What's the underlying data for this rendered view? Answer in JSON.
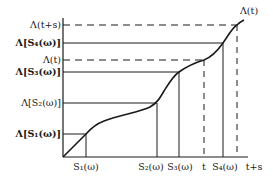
{
  "diagram": {
    "type": "monotone-curve-with-projections",
    "curve_label": "Λ(t)",
    "colors": {
      "ink": "#1a1a1a",
      "background": "#ffffff"
    },
    "y_axis_labels": [
      {
        "id": "lambda_t_plus_s",
        "text": "Λ(t+s)",
        "style": "dashed"
      },
      {
        "id": "lambda_s4",
        "text": "Λ[S₄(ω)]",
        "style": "solid"
      },
      {
        "id": "lambda_t",
        "text": "Λ(t)",
        "style": "dashed"
      },
      {
        "id": "lambda_s3",
        "text": "Λ[S₃(ω)]",
        "style": "solid"
      },
      {
        "id": "lambda_s2",
        "text": "Λ[S₂(ω)]",
        "style": "solid"
      },
      {
        "id": "lambda_s1",
        "text": "Λ[S₁(ω)]",
        "style": "solid"
      }
    ],
    "x_axis_labels": [
      {
        "id": "s1",
        "text": "S₁(ω)",
        "style": "solid"
      },
      {
        "id": "s2",
        "text": "S₂(ω)",
        "style": "solid"
      },
      {
        "id": "s3",
        "text": "S₃(ω)",
        "style": "solid"
      },
      {
        "id": "t",
        "text": "t",
        "style": "dashed"
      },
      {
        "id": "s4",
        "text": "S₄(ω)",
        "style": "solid"
      },
      {
        "id": "t_plus_s",
        "text": "t+s",
        "style": "dashed"
      }
    ]
  }
}
